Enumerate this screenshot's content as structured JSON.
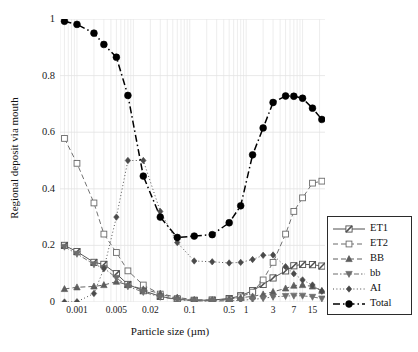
{
  "chart_data": {
    "type": "line",
    "title": "",
    "xlabel": "Particle size (µm)",
    "ylabel": "Regional deposit via mouth",
    "xscale": "log",
    "xlim": [
      0.0005,
      25
    ],
    "ylim": [
      0,
      1
    ],
    "ytick_values": [
      0,
      0.2,
      0.4,
      0.6,
      0.8,
      1
    ],
    "ytick_labels": [
      "0",
      "0.2",
      "0.4",
      "0.6",
      "0.8",
      "1"
    ],
    "xtick_values": [
      0.001,
      0.005,
      0.02,
      0.1,
      0.5,
      1,
      3,
      7,
      15
    ],
    "xtick_labels": [
      "0.001",
      "0.005",
      "0.02",
      "0.1",
      "0.5",
      "1",
      "3",
      "7",
      "15"
    ],
    "grid": "vertical-and-horizontal",
    "legend_position": "right-outside",
    "x": [
      0.0006,
      0.001,
      0.002,
      0.003,
      0.005,
      0.008,
      0.015,
      0.03,
      0.06,
      0.12,
      0.25,
      0.5,
      0.8,
      1.3,
      2,
      3,
      5,
      7,
      10,
      15,
      22
    ],
    "series": [
      {
        "name": "ET1",
        "marker": "square-diagonal",
        "line": "solid",
        "color": "#4f4f4f",
        "values": [
          0.2,
          0.178,
          0.14,
          0.133,
          0.1,
          0.062,
          0.04,
          0.02,
          0.009,
          0.006,
          0.007,
          0.012,
          0.022,
          0.04,
          0.062,
          0.085,
          0.11,
          0.128,
          0.133,
          0.132,
          0.127
        ]
      },
      {
        "name": "ET2",
        "marker": "open-square",
        "line": "dashed",
        "color": "#6a6a6a",
        "values": [
          0.578,
          0.49,
          0.35,
          0.24,
          0.175,
          0.11,
          0.06,
          0.028,
          0.012,
          0.005,
          0.004,
          0.008,
          0.018,
          0.035,
          0.078,
          0.14,
          0.24,
          0.32,
          0.368,
          0.42,
          0.427
        ]
      },
      {
        "name": "BB",
        "marker": "triangle-up",
        "line": "dashed",
        "color": "#5d5d5d",
        "values": [
          0.046,
          0.052,
          0.055,
          0.06,
          0.072,
          0.06,
          0.045,
          0.03,
          0.016,
          0.008,
          0.007,
          0.011,
          0.015,
          0.02,
          0.027,
          0.036,
          0.048,
          0.058,
          0.06,
          0.055,
          0.04
        ]
      },
      {
        "name": "bb",
        "marker": "triangle-down",
        "line": "dash-dot",
        "color": "#6d6d6d",
        "values": [
          0.195,
          0.17,
          0.133,
          0.12,
          0.085,
          0.055,
          0.035,
          0.018,
          0.008,
          0.004,
          0.003,
          0.004,
          0.006,
          0.009,
          0.013,
          0.018,
          0.021,
          0.022,
          0.022,
          0.018,
          0.012
        ]
      },
      {
        "name": "AI",
        "marker": "diamond",
        "line": "dotted",
        "color": "#4a4a4a",
        "values": [
          0.0,
          0.001,
          0.03,
          0.118,
          0.3,
          0.5,
          0.5,
          0.32,
          0.21,
          0.145,
          0.142,
          0.138,
          0.14,
          0.15,
          0.165,
          0.166,
          0.125,
          0.1,
          0.078,
          0.06,
          0.038
        ]
      },
      {
        "name": "Total",
        "marker": "filled-circle",
        "line": "dash-dot-thick",
        "color": "#000000",
        "values": [
          0.992,
          0.981,
          0.95,
          0.91,
          0.865,
          0.73,
          0.445,
          0.3,
          0.228,
          0.233,
          0.238,
          0.28,
          0.34,
          0.52,
          0.615,
          0.705,
          0.728,
          0.727,
          0.72,
          0.685,
          0.645
        ]
      }
    ]
  },
  "axes": {
    "y_label": "Regional deposit via mouth",
    "x_label": "Particle size (µm)",
    "y_ticks": [
      "1",
      "0.8",
      "0.6",
      "0.4",
      "0.2",
      "0"
    ],
    "x_ticks": [
      "0.001",
      "0.005",
      "0.02",
      "0.1",
      "0.5",
      "1",
      "3",
      "7",
      "15"
    ]
  },
  "legend": {
    "items": [
      {
        "label": "ET1"
      },
      {
        "label": "ET2"
      },
      {
        "label": "BB"
      },
      {
        "label": "bb"
      },
      {
        "label": "AI"
      },
      {
        "label": "Total"
      }
    ]
  }
}
